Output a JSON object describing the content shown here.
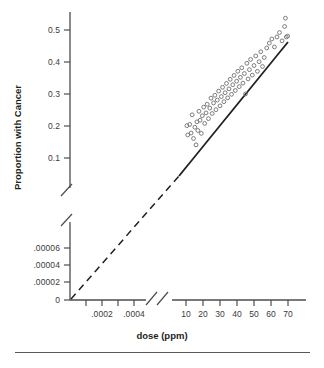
{
  "figure": {
    "background_color": "#ffffff",
    "ink_color": "#231f20",
    "rule_color": "#58595b"
  },
  "chart_data": {
    "type": "scatter",
    "title": "",
    "subtitle": "",
    "xlabel": "dose (ppm)",
    "ylabel": "Proportion with Cancer",
    "grid": false,
    "legend": null,
    "axis_breaks": {
      "x": {
        "present": true,
        "style": "double-slash",
        "between": [
          0.0005,
          5
        ]
      },
      "y": {
        "present": true,
        "style": "double-slash",
        "between": [
          7e-05,
          0.05
        ]
      }
    },
    "xaxis": {
      "segments": [
        {
          "name": "low-dose",
          "ticks": [
            0.0002,
            0.0004
          ],
          "tick_labels": [
            ".0002",
            ".0004"
          ],
          "minor_ticks": [
            0.0001,
            0.0003,
            0.0005
          ]
        },
        {
          "name": "high-dose",
          "ticks": [
            10,
            20,
            30,
            40,
            50,
            60,
            70
          ],
          "tick_labels": [
            "10",
            "20",
            "30",
            "40",
            "50",
            "60",
            "70"
          ]
        }
      ],
      "units": "ppm"
    },
    "yaxis": {
      "segments": [
        {
          "name": "low-proportion",
          "ticks": [
            0,
            2e-05,
            4e-05,
            6e-05
          ],
          "tick_labels": [
            "0",
            ".00002",
            ".00004",
            ".00006"
          ]
        },
        {
          "name": "high-proportion",
          "ticks": [
            0.1,
            0.2,
            0.3,
            0.4,
            0.5
          ],
          "tick_labels": [
            "0.1",
            "0.2",
            "0.3",
            "0.4",
            "0.5"
          ]
        }
      ]
    },
    "fit_line": {
      "description": "linear fit through observed high-dose data, extrapolated as dashed line down to the origin",
      "solid_segment": {
        "x": [
          8.0,
          70.0
        ],
        "y": [
          0.137,
          0.523
        ]
      },
      "dashed_segment": {
        "x": [
          0.0,
          8.0
        ],
        "y": [
          0.0,
          0.137
        ]
      },
      "slope_per_ppm": 0.00623,
      "intercept": 0.0
    },
    "series": [
      {
        "name": "observed",
        "marker": "open-circle",
        "marker_color": "#6d6e71",
        "points": [
          [
            10.5,
            0.201
          ],
          [
            11.0,
            0.172
          ],
          [
            12.2,
            0.205
          ],
          [
            13.0,
            0.178
          ],
          [
            13.6,
            0.235
          ],
          [
            14.4,
            0.161
          ],
          [
            15.2,
            0.196
          ],
          [
            15.9,
            0.141
          ],
          [
            16.4,
            0.213
          ],
          [
            17.0,
            0.186
          ],
          [
            17.6,
            0.246
          ],
          [
            18.3,
            0.218
          ],
          [
            19.0,
            0.177
          ],
          [
            19.6,
            0.232
          ],
          [
            20.4,
            0.259
          ],
          [
            21.0,
            0.208
          ],
          [
            21.8,
            0.241
          ],
          [
            22.5,
            0.268
          ],
          [
            23.2,
            0.223
          ],
          [
            24.0,
            0.256
          ],
          [
            24.7,
            0.287
          ],
          [
            25.4,
            0.239
          ],
          [
            26.2,
            0.272
          ],
          [
            27.0,
            0.296
          ],
          [
            27.6,
            0.251
          ],
          [
            28.4,
            0.281
          ],
          [
            29.2,
            0.309
          ],
          [
            30.0,
            0.263
          ],
          [
            30.8,
            0.292
          ],
          [
            31.5,
            0.321
          ],
          [
            32.3,
            0.276
          ],
          [
            33.0,
            0.304
          ],
          [
            33.8,
            0.333
          ],
          [
            34.5,
            0.288
          ],
          [
            35.3,
            0.316
          ],
          [
            36.0,
            0.346
          ],
          [
            36.8,
            0.299
          ],
          [
            37.5,
            0.329
          ],
          [
            38.3,
            0.358
          ],
          [
            39.0,
            0.311
          ],
          [
            39.8,
            0.34
          ],
          [
            40.5,
            0.371
          ],
          [
            41.3,
            0.323
          ],
          [
            42.0,
            0.352
          ],
          [
            42.8,
            0.382
          ],
          [
            43.5,
            0.334
          ],
          [
            44.3,
            0.364
          ],
          [
            45.0,
            0.3
          ],
          [
            45.8,
            0.396
          ],
          [
            46.5,
            0.347
          ],
          [
            47.3,
            0.376
          ],
          [
            48.0,
            0.408
          ],
          [
            49.0,
            0.359
          ],
          [
            50.0,
            0.389
          ],
          [
            51.0,
            0.419
          ],
          [
            52.0,
            0.371
          ],
          [
            53.0,
            0.401
          ],
          [
            54.0,
            0.432
          ],
          [
            55.0,
            0.386
          ],
          [
            56.0,
            0.414
          ],
          [
            57.5,
            0.444
          ],
          [
            59.0,
            0.459
          ],
          [
            60.5,
            0.472
          ],
          [
            62.0,
            0.447
          ],
          [
            63.5,
            0.478
          ],
          [
            65.0,
            0.492
          ],
          [
            66.5,
            0.466
          ],
          [
            68.0,
            0.511
          ],
          [
            69.0,
            0.478
          ],
          [
            69.8,
            0.481
          ],
          [
            68.5,
            0.537
          ]
        ]
      }
    ]
  },
  "geometry": {
    "y_axis_x": 70,
    "x_axis_y": 300,
    "y_top": 12,
    "x_right": 306,
    "y_break_top": 188,
    "y_break_bottom": 222,
    "x_break_left": 142,
    "x_break_right": 176,
    "y_upper_ticks_px": [
      30,
      62,
      94,
      126,
      158
    ],
    "y_lower_ticks_px": [
      300,
      282,
      265,
      248
    ],
    "x_low_ticks_px": [
      86,
      102,
      118,
      134,
      150
    ],
    "x_low_label_px": [
      102,
      134
    ],
    "x_high_ticks_px": [
      186,
      203,
      220,
      237,
      254,
      271,
      288
    ]
  }
}
